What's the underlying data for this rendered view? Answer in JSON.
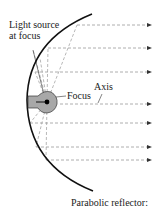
{
  "labels": {
    "light_source_line1": "Light source",
    "light_source_line2": "at focus",
    "focus": "Focus",
    "axis": "Axis",
    "caption": "Parabolic reflector:"
  },
  "colors": {
    "reflector": "#111111",
    "rays": "#9a9a9a",
    "bulb_fill": "#a8a8a8",
    "bulb_stroke": "#333333",
    "text": "#222222"
  },
  "rays_y": [
    25,
    48,
    72,
    104,
    123,
    147,
    160
  ]
}
